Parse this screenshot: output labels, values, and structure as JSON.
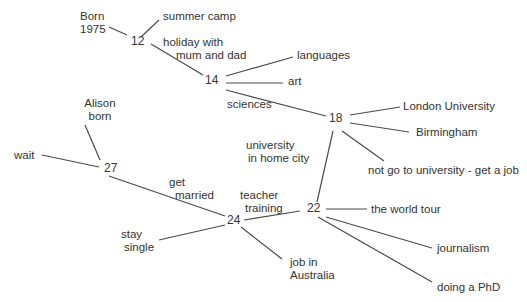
{
  "diagram": {
    "type": "life-choices-timeline-tree",
    "nodes": [
      {
        "id": "n12",
        "label": "12",
        "x": 138,
        "y": 41
      },
      {
        "id": "n14",
        "label": "14",
        "x": 211,
        "y": 80
      },
      {
        "id": "n18",
        "label": "18",
        "x": 336,
        "y": 118
      },
      {
        "id": "n22",
        "label": "22",
        "x": 314,
        "y": 208
      },
      {
        "id": "n24",
        "label": "24",
        "x": 231,
        "y": 220
      },
      {
        "id": "n27",
        "label": "27",
        "x": 111,
        "y": 168
      }
    ],
    "labels": [
      {
        "id": "born1975",
        "lines": [
          "Born",
          "1975"
        ],
        "x": 80,
        "y": 10
      },
      {
        "id": "summer-camp",
        "lines": [
          "summer camp"
        ],
        "x": 163,
        "y": 10
      },
      {
        "id": "holiday",
        "lines": [
          "holiday with",
          "  mum and dad"
        ],
        "x": 163,
        "y": 35
      },
      {
        "id": "languages",
        "lines": [
          "languages"
        ],
        "x": 297,
        "y": 49
      },
      {
        "id": "art",
        "lines": [
          "art"
        ],
        "x": 288,
        "y": 75
      },
      {
        "id": "sciences",
        "lines": [
          "sciences"
        ],
        "x": 227,
        "y": 101
      },
      {
        "id": "london-university",
        "lines": [
          "London University"
        ],
        "x": 403,
        "y": 100
      },
      {
        "id": "birmingham",
        "lines": [
          "Birmingham"
        ],
        "x": 416,
        "y": 125
      },
      {
        "id": "university-home-city",
        "lines": [
          "university",
          " in  home city"
        ],
        "x": 247,
        "y": 137
      },
      {
        "id": "not-go-university",
        "lines": [
          "not go to university - get a job"
        ],
        "x": 368,
        "y": 163
      },
      {
        "id": "alison-born",
        "lines": [
          "Alison",
          "born"
        ],
        "x": 80,
        "y": 97
      },
      {
        "id": "wait",
        "lines": [
          "wait"
        ],
        "x": 14,
        "y": 148
      },
      {
        "id": "get-married",
        "lines": [
          "get",
          "  married"
        ],
        "x": 169,
        "y": 176
      },
      {
        "id": "teacher-training",
        "lines": [
          "teacher",
          "  training"
        ],
        "x": 240,
        "y": 189
      },
      {
        "id": "the-world-tour",
        "lines": [
          "the world tour"
        ],
        "x": 371,
        "y": 203
      },
      {
        "id": "stay-single",
        "lines": [
          "stay",
          " single"
        ],
        "x": 121,
        "y": 227
      },
      {
        "id": "journalism",
        "lines": [
          "journalism"
        ],
        "x": 437,
        "y": 242
      },
      {
        "id": "job-in-australia",
        "lines": [
          "job in",
          "Australia"
        ],
        "x": 290,
        "y": 256
      },
      {
        "id": "doing-a-phd",
        "lines": [
          "doing a PhD"
        ],
        "x": 437,
        "y": 280
      }
    ],
    "edges": [
      {
        "from": "born1975",
        "to": "n12",
        "x1": 109,
        "y1": 27,
        "x2": 127,
        "y2": 35
      },
      {
        "from": "n12",
        "to": "summer-camp",
        "x1": 141,
        "y1": 37,
        "x2": 159,
        "y2": 20
      },
      {
        "from": "n12",
        "to": "n14",
        "x1": 151,
        "y1": 44,
        "x2": 203,
        "y2": 75
      },
      {
        "from": "n14",
        "to": "languages",
        "x1": 226,
        "y1": 76,
        "x2": 293,
        "y2": 57
      },
      {
        "from": "n14",
        "to": "art",
        "x1": 226,
        "y1": 83,
        "x2": 283,
        "y2": 83
      },
      {
        "from": "n14",
        "to": "n18",
        "x1": 226,
        "y1": 90,
        "x2": 326,
        "y2": 116
      },
      {
        "from": "n18",
        "to": "london-university",
        "x1": 350,
        "y1": 115,
        "x2": 400,
        "y2": 107
      },
      {
        "from": "n18",
        "to": "birmingham",
        "x1": 350,
        "y1": 123,
        "x2": 409,
        "y2": 132
      },
      {
        "from": "n18",
        "to": "not-go-university",
        "x1": 342,
        "y1": 131,
        "x2": 384,
        "y2": 161
      },
      {
        "from": "n18",
        "to": "n22",
        "x1": 333,
        "y1": 131,
        "x2": 317,
        "y2": 202
      },
      {
        "from": "n22",
        "to": "the-world-tour",
        "x1": 326,
        "y1": 209,
        "x2": 367,
        "y2": 209
      },
      {
        "from": "n22",
        "to": "journalism",
        "x1": 326,
        "y1": 217,
        "x2": 432,
        "y2": 248
      },
      {
        "from": "n22",
        "to": "doing-a-phd",
        "x1": 318,
        "y1": 217,
        "x2": 432,
        "y2": 282
      },
      {
        "from": "n22",
        "to": "n24",
        "x1": 300,
        "y1": 211,
        "x2": 244,
        "y2": 220
      },
      {
        "from": "n24",
        "to": "job-in-australia",
        "x1": 241,
        "y1": 227,
        "x2": 282,
        "y2": 259
      },
      {
        "from": "n24",
        "to": "stay-single",
        "x1": 225,
        "y1": 225,
        "x2": 159,
        "y2": 240
      },
      {
        "from": "n24",
        "to": "n27",
        "x1": 225,
        "y1": 216,
        "x2": 109,
        "y2": 176
      },
      {
        "from": "n27",
        "to": "alison-born",
        "x1": 100,
        "y1": 160,
        "x2": 85,
        "y2": 125
      },
      {
        "from": "n27",
        "to": "wait",
        "x1": 99,
        "y1": 167,
        "x2": 42,
        "y2": 155
      }
    ]
  }
}
